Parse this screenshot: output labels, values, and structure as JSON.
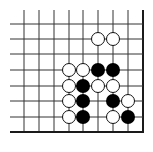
{
  "diagram": {
    "type": "go-board-fragment",
    "colors": {
      "background": "#ffffff",
      "grid_line": "#333333",
      "edge_line": "#1a1a1a",
      "black_stone": "#000000",
      "white_stone_fill": "#ffffff",
      "white_stone_stroke": "#111111"
    },
    "grid": {
      "columns_x": [
        24,
        39,
        54,
        69,
        83,
        98,
        113,
        128,
        143
      ],
      "rows_y": [
        24,
        39,
        54,
        70,
        86,
        101,
        117,
        132
      ],
      "line_start_x": 10,
      "line_start_y": 10,
      "right_edge_x": 143,
      "bottom_edge_y": 132,
      "stone_radius": 7
    },
    "stones": [
      {
        "color": "white",
        "col": 5,
        "row": 1
      },
      {
        "color": "white",
        "col": 6,
        "row": 1
      },
      {
        "color": "white",
        "col": 3,
        "row": 3
      },
      {
        "color": "white",
        "col": 4,
        "row": 3
      },
      {
        "color": "black",
        "col": 5,
        "row": 3
      },
      {
        "color": "black",
        "col": 6,
        "row": 3
      },
      {
        "color": "white",
        "col": 3,
        "row": 4
      },
      {
        "color": "black",
        "col": 4,
        "row": 4
      },
      {
        "color": "white",
        "col": 5,
        "row": 4
      },
      {
        "color": "white",
        "col": 6,
        "row": 4
      },
      {
        "color": "white",
        "col": 3,
        "row": 5
      },
      {
        "color": "black",
        "col": 4,
        "row": 5
      },
      {
        "color": "black",
        "col": 6,
        "row": 5
      },
      {
        "color": "white",
        "col": 7,
        "row": 5
      },
      {
        "color": "white",
        "col": 3,
        "row": 6
      },
      {
        "color": "black",
        "col": 4,
        "row": 6
      },
      {
        "color": "white",
        "col": 6,
        "row": 6
      },
      {
        "color": "black",
        "col": 7,
        "row": 6
      }
    ]
  }
}
